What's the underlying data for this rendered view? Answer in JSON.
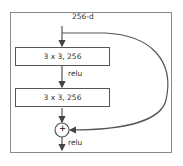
{
  "diagram": {
    "type": "residual-block",
    "input_label": "256-d",
    "layers": [
      {
        "label": "3 x 3, 256"
      },
      {
        "label": "3 x 3, 256"
      }
    ],
    "activation_between": "relu",
    "sum_symbol": "+",
    "output_activation": "relu",
    "colors": {
      "stroke": "#555555",
      "frame": "#8a8a8a",
      "text": "#333333"
    }
  }
}
